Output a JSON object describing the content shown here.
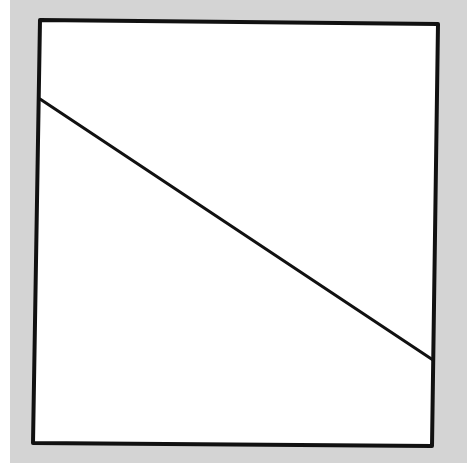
{
  "diagram": {
    "colors": {
      "background": "#d4d4d4",
      "fill": "#ffffff",
      "stroke": "#111111",
      "left_strip": "#ffffff"
    },
    "square": {
      "corners": [
        [
          40,
          20
        ],
        [
          438,
          24
        ],
        [
          432,
          446
        ],
        [
          33,
          443
        ]
      ],
      "stroke_width": 4
    },
    "diagonal_line": {
      "from": [
        40,
        99
      ],
      "to": [
        433,
        360
      ],
      "stroke_width": 3
    }
  }
}
